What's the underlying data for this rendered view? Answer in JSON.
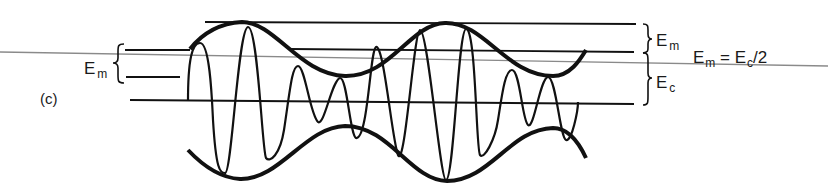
{
  "figure": {
    "panel_label": "(c)",
    "left_bracket_label": {
      "main": "E",
      "sub": "m"
    },
    "right_bracket_top_label": {
      "main": "E",
      "sub": "m"
    },
    "right_bracket_bottom_label": {
      "main": "E",
      "sub": "c"
    },
    "equation": {
      "lhs_main": "E",
      "lhs_sub": "m",
      "equals": " = ",
      "rhs_main": "E",
      "rhs_sub": "c",
      "rhs_tail": "/2"
    },
    "colors": {
      "ink": "#111111",
      "guide_line": "#888888",
      "background": "#ffffff"
    }
  }
}
